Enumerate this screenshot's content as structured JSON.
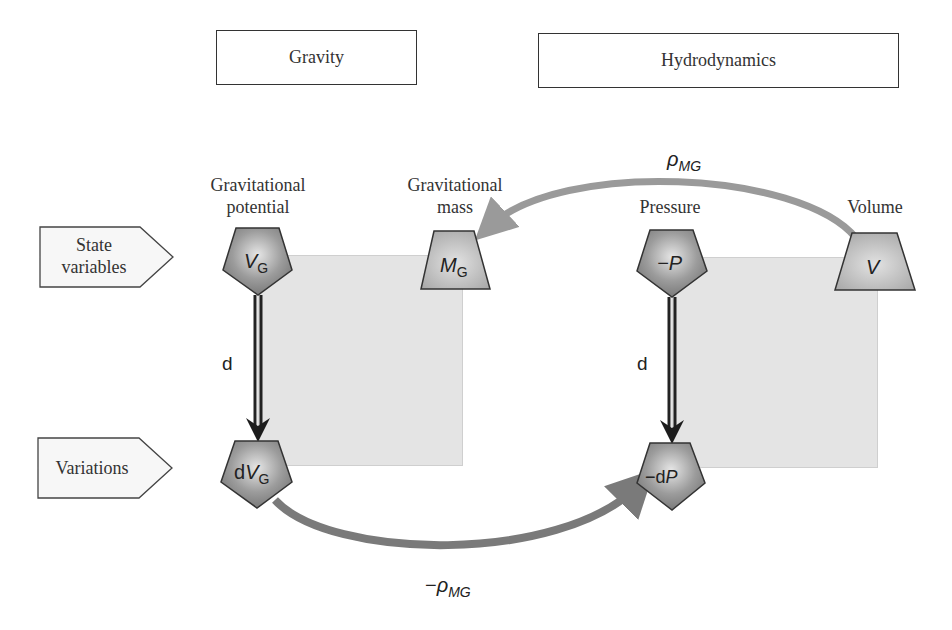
{
  "headers": {
    "gravity": "Gravity",
    "hydrodynamics": "Hydrodynamics"
  },
  "row_tags": {
    "state_variables": [
      "State",
      "variables"
    ],
    "variations": "Variations"
  },
  "labels": {
    "grav_potential": [
      "Gravitational",
      "potential"
    ],
    "grav_mass": [
      "Gravitational",
      "mass"
    ],
    "pressure": "Pressure",
    "volume": "Volume"
  },
  "nodes": {
    "vg": {
      "main": "V",
      "sub": "G",
      "shape": "pentagon"
    },
    "mg": {
      "main": "M",
      "sub": "G",
      "shape": "trapezoid"
    },
    "neg_p": {
      "main": "−P",
      "shape": "pentagon"
    },
    "v": {
      "main": "V",
      "shape": "trapezoid"
    },
    "dvg": {
      "prefix": "d",
      "main": "V",
      "sub": "G",
      "shape": "pentagon"
    },
    "neg_dp": {
      "prefix": "−d",
      "main": "P",
      "shape": "pentagon"
    }
  },
  "edges": {
    "d_left": "d",
    "d_right": "d",
    "top_arc": {
      "main": "ρ",
      "sub": "MG"
    },
    "bottom_arc": {
      "prefix": "−",
      "main": "ρ",
      "sub": "MG"
    }
  },
  "colors": {
    "node_fill_dark": "#8e8e8e",
    "node_fill_light": "#b4b4b4",
    "arc_gray": "#9a9a9a",
    "arc_dark_gray": "#7a7a7a",
    "box_gray": "#e4e4e4",
    "stroke": "#333333"
  }
}
